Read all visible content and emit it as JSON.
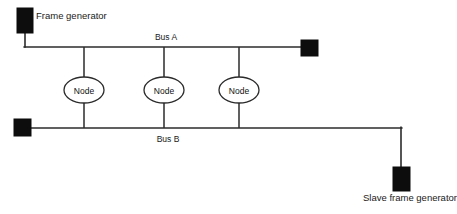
{
  "diagram": {
    "type": "network-topology",
    "width": 457,
    "height": 214,
    "background_color": "#ffffff",
    "line_color": "#2b2b2b",
    "terminator_color": "#0d0d0d",
    "text_color": "#1a1a1a"
  },
  "labels": {
    "frame_generator": "Frame generator",
    "bus_a": "Bus A",
    "bus_b": "Bus B",
    "slave_frame_generator": "Slave frame generator"
  },
  "nodes": [
    {
      "label": "Node",
      "cx": 84,
      "cy": 90
    },
    {
      "label": "Node",
      "cx": 164,
      "cy": 90
    },
    {
      "label": "Node",
      "cx": 239,
      "cy": 90
    }
  ],
  "buses": [
    {
      "name": "Bus A",
      "label": "Bus A",
      "y": 47,
      "x_start": 25,
      "x_end": 302,
      "label_x": 166,
      "label_y": 38
    },
    {
      "name": "Bus B",
      "label": "Bus B",
      "y": 128,
      "x_start": 22,
      "x_end": 401,
      "label_x": 168,
      "label_y": 140
    }
  ],
  "terminators": [
    {
      "name": "frame-generator-block",
      "x": 17,
      "y": 8,
      "width": 16,
      "height": 25
    },
    {
      "name": "bus-a-right-terminator",
      "x": 301,
      "y": 41,
      "width": 17,
      "height": 16
    },
    {
      "name": "bus-b-left-terminator",
      "x": 14,
      "y": 119,
      "width": 17,
      "height": 17
    },
    {
      "name": "slave-frame-generator-block",
      "x": 393,
      "y": 167,
      "width": 17,
      "height": 24
    }
  ],
  "label_positions": {
    "frame_generator": {
      "x": 36,
      "y": 15
    },
    "slave_frame_generator": {
      "x": 363,
      "y": 197
    }
  },
  "geometry": {
    "node_rx": 20,
    "node_ry": 13,
    "frame_gen_stub_x": 25,
    "frame_gen_stub_top": 33,
    "slave_drop_x": 401,
    "slave_drop_top": 128,
    "slave_drop_bottom": 167
  }
}
